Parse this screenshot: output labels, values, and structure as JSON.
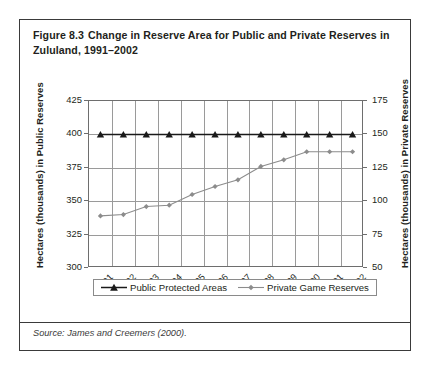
{
  "figure": {
    "number": "Figure 8.3",
    "title": "Change in Reserve Area for Public and Private Reserves in Zululand, 1991–2002",
    "source": "Source: James and Creemers (2000)."
  },
  "colors": {
    "public_series": "#1a1a1a",
    "private_series": "#8c8c8c",
    "grid": "#9a9a9a",
    "axis": "#6e6e6e",
    "border": "#3a3a3a",
    "text": "#231f20",
    "background": "#ffffff"
  },
  "chart_data": {
    "type": "line",
    "title": "Change in Reserve Area for Public and Private Reserves in Zululand, 1991–2002",
    "xlabel": "",
    "ylabel": "Hectares (thousands) in Public Reserves",
    "y2label": "Hectares (thousands) in Private Reserves",
    "categories": [
      "1991",
      "1992",
      "1993",
      "1994",
      "1995",
      "1996",
      "1997",
      "1998",
      "1999",
      "2000",
      "2001",
      "2002"
    ],
    "ylim": [
      300,
      425
    ],
    "yticks": [
      300,
      325,
      350,
      375,
      400,
      425
    ],
    "y2lim": [
      50,
      175
    ],
    "y2ticks": [
      50,
      75,
      100,
      125,
      150,
      175
    ],
    "grid": true,
    "legend_position": "bottom",
    "series": [
      {
        "name": "Public Protected Areas",
        "axis": "left",
        "marker": "triangle",
        "color": "#1a1a1a",
        "values": [
          400,
          400,
          400,
          400,
          400,
          400,
          400,
          400,
          400,
          400,
          400,
          400
        ]
      },
      {
        "name": "Private Game Reserves",
        "axis": "right",
        "marker": "diamond",
        "color": "#8c8c8c",
        "values": [
          89,
          90,
          96,
          97,
          105,
          111,
          116,
          126,
          131,
          137,
          137,
          137
        ]
      }
    ],
    "series_private_left_axis_equivalent": [
      339,
      340,
      346,
      347,
      355,
      361,
      366,
      376,
      381,
      387,
      387,
      387
    ]
  }
}
